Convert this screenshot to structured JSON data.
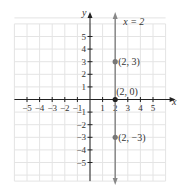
{
  "chart_data": {
    "type": "line",
    "title": "",
    "xlabel": "x",
    "ylabel": "y",
    "xlim": [
      -6,
      6
    ],
    "ylim": [
      -6,
      6
    ],
    "grid": true,
    "x_ticks": [
      -5,
      -4,
      -3,
      -2,
      -1,
      1,
      2,
      3,
      4,
      5
    ],
    "y_ticks": [
      -5,
      -4,
      -3,
      -2,
      -1,
      1,
      2,
      3,
      4,
      5
    ],
    "x_tick_labels": [
      "−5",
      "−4",
      "−3",
      "−2",
      "−1",
      "1",
      "2",
      "3",
      "4",
      "5"
    ],
    "y_tick_labels": [
      "−5",
      "−4",
      "−3",
      "−2",
      "−1",
      "1",
      "2",
      "3",
      "4",
      "5"
    ],
    "series": [
      {
        "name": "x = 2",
        "kind": "vertical-line",
        "x": 2,
        "label": "x = 2"
      }
    ],
    "points": [
      {
        "x": 2,
        "y": 3,
        "label": "(2, 3)"
      },
      {
        "x": 2,
        "y": 0,
        "label": "(2, 0)"
      },
      {
        "x": 2,
        "y": -3,
        "label": "(2, −3)"
      }
    ],
    "colors": {
      "line": "#888888",
      "point": "#777777",
      "axis": "#222222",
      "grid": "#e4e4e4"
    }
  }
}
